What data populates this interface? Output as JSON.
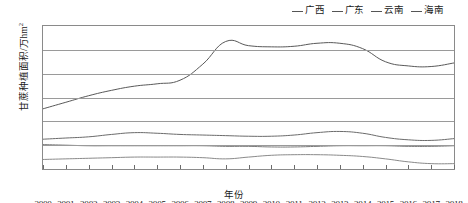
{
  "chart_data": {
    "type": "line",
    "title": "",
    "xlabel": "年份",
    "ylabel": "甘蔗种植面积/万hm",
    "ylabel_sup": "2",
    "ylim": [
      0,
      120
    ],
    "ytick_step": 20,
    "yticks": [
      0,
      20,
      40,
      60,
      80,
      100,
      120
    ],
    "grid": true,
    "legend_position": "top-right",
    "categories": [
      "2000",
      "2001",
      "2002",
      "2003",
      "2004",
      "2005",
      "2006",
      "2007",
      "2008",
      "2009",
      "2010",
      "2011",
      "2012",
      "2013",
      "2014",
      "2015",
      "2016",
      "2017",
      "2018"
    ],
    "series": [
      {
        "name": "广西",
        "color": "#595959",
        "values": [
          50.5,
          56.0,
          61.5,
          66.0,
          69.5,
          71.5,
          74.5,
          88.0,
          107.0,
          103.5,
          102.5,
          103.0,
          105.5,
          105.5,
          101.0,
          90.0,
          86.5,
          86.0,
          89.0
        ]
      },
      {
        "name": "广东",
        "color": "#6b6b6b",
        "values": [
          25.0,
          26.0,
          27.0,
          29.0,
          30.5,
          30.0,
          29.0,
          28.5,
          28.0,
          27.5,
          27.5,
          28.5,
          30.5,
          31.5,
          30.0,
          26.5,
          24.5,
          24.0,
          25.5
        ]
      },
      {
        "name": "云南",
        "color": "#7a7a7a",
        "values": [
          20.5,
          20.0,
          19.5,
          19.5,
          19.5,
          19.5,
          19.5,
          19.5,
          19.0,
          19.0,
          18.5,
          18.5,
          19.0,
          19.5,
          19.5,
          19.5,
          19.0,
          19.0,
          19.5
        ]
      },
      {
        "name": "海南",
        "color": "#8a8a8a",
        "values": [
          8.0,
          8.5,
          9.0,
          9.5,
          10.0,
          10.0,
          10.0,
          9.5,
          8.5,
          10.0,
          11.5,
          12.0,
          12.0,
          11.5,
          10.5,
          8.5,
          6.0,
          4.5,
          4.5
        ]
      }
    ]
  }
}
